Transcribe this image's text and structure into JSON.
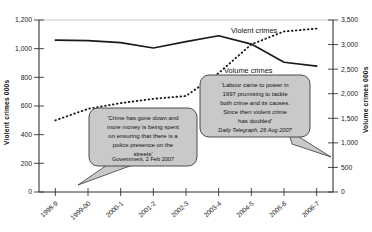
{
  "chart_data": {
    "type": "line",
    "title": "",
    "xlabel": "",
    "grid": false,
    "legend_position": "inline-right",
    "categories": [
      "1998-9",
      "1999-00",
      "2000-1",
      "2001-2",
      "2002-3",
      "2003-4",
      "2004-5",
      "2005-6",
      "2006-7"
    ],
    "axes": {
      "left": {
        "label": "Violent crimes 000s",
        "ylim": [
          0,
          1200
        ],
        "ticks": [
          0,
          200,
          400,
          600,
          800,
          1000,
          1200
        ],
        "tick_labels": [
          "0",
          "200",
          "400",
          "600",
          "800",
          "1,000",
          "1,200"
        ]
      },
      "right": {
        "label": "Volume crimes 000s",
        "ylim": [
          0,
          3500
        ],
        "ticks": [
          0,
          500,
          1000,
          1500,
          2000,
          2500,
          3000,
          3500
        ],
        "tick_labels": [
          "0",
          "500",
          "1,000",
          "1,500",
          "2,000",
          "2,500",
          "3,000",
          "3,500"
        ]
      }
    },
    "series": [
      {
        "name": "Violent crimes",
        "axis": "left",
        "style": "dotted",
        "label": "Violent crimes",
        "values": [
          500,
          580,
          620,
          650,
          670,
          830,
          1030,
          1120,
          1140
        ]
      },
      {
        "name": "Volume crimes",
        "axis": "right",
        "style": "solid",
        "label": "Volume crimes",
        "values": [
          3090,
          3080,
          3040,
          2930,
          3060,
          3180,
          3010,
          2640,
          2560
        ]
      }
    ],
    "annotations": [
      {
        "id": "government-quote",
        "lines": [
          "'Crime has gone down and",
          "more money is being spent",
          "on ensuring that there is a",
          "police presence on the",
          "streets'"
        ],
        "source": "Government, 2 Feb 2007",
        "source_italic": false
      },
      {
        "id": "telegraph-quote",
        "lines": [
          "'Labour came to power in",
          "1997 promising to tackle",
          "both crime and its causes.",
          "Since then violent crime",
          "has doubled'"
        ],
        "source": "Daily Telegraph, 26 Aug 2007",
        "source_italic": true
      }
    ],
    "colors": {
      "line": "#1a1a1a",
      "axis": "#333333",
      "callout_fill": "#c9c9c9",
      "callout_stroke": "#3a3a3a",
      "background": "#ffffff"
    }
  }
}
